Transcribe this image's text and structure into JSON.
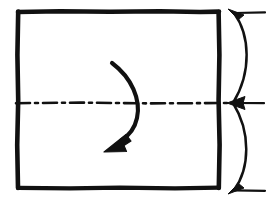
{
  "drawing": {
    "title": "Hand-drawn technical sketch: rectangular plate with horizontal centerline, rotation arrow and vertical dimension bracket",
    "style": "freehand ink line drawing, black on white",
    "canvas": {
      "width": 271,
      "height": 206,
      "background": "#ffffff"
    },
    "ink_color": "#111111",
    "elements": {
      "rectangle": {
        "name": "plate-outline",
        "description": "Large hand-drawn rectangle occupying the left portion of the frame",
        "left": 17,
        "top": 11,
        "right": 219,
        "bottom": 188,
        "stroke_width": 4.5
      },
      "centerline": {
        "name": "horizontal-centerline",
        "description": "Dash-dot-dash centerline running horizontally through the rectangle, extending slightly past the right edge",
        "y": 103,
        "x_start": 16,
        "x_end": 228,
        "pattern": "dash-dot",
        "stroke_width": 2.6,
        "dash_array": "14 5 3 5"
      },
      "rotation_arrow": {
        "name": "rotation-arrow",
        "description": "Curved arrow bowing to the right, starting at upper left, crossing the centerline, ending with a solid arrowhead pointing down-left",
        "start_x": 112,
        "start_y": 63,
        "end_x": 118,
        "end_y": 137,
        "bulge_x": 140,
        "arrowhead_angle_deg": 215,
        "stroke_width": 4.0
      },
      "dimension_bracket": {
        "name": "dimension-bracket",
        "description": "Two convex arcs forming a lens/brace shape to the right of the rectangle with three arrow tick marks",
        "top_point": {
          "x": 234,
          "y": 13
        },
        "middle_point": {
          "x": 233,
          "y": 103
        },
        "bottom_point": {
          "x": 234,
          "y": 190
        },
        "arc_bulge_x": 252,
        "stroke_width": 2.4,
        "ticks": [
          {
            "name": "top-arrow-tick",
            "direction": "up-left",
            "x": 234,
            "y": 13,
            "leader_x_end": 265
          },
          {
            "name": "middle-arrow-tick",
            "direction": "left",
            "x": 233,
            "y": 103,
            "leader_x_end": 264
          },
          {
            "name": "bottom-arrow-tick",
            "direction": "down-left",
            "x": 234,
            "y": 190,
            "leader_x_end": 265
          }
        ]
      }
    }
  }
}
